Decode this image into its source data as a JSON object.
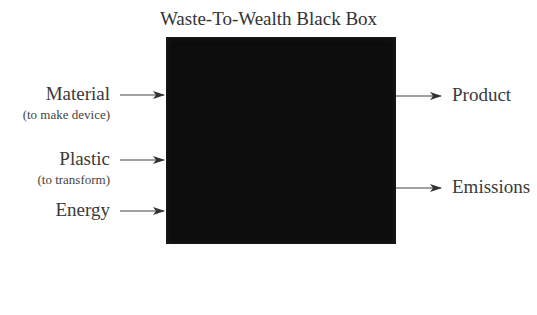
{
  "diagram": {
    "title": "Waste-To-Wealth Black Box",
    "inputs": [
      {
        "label": "Material",
        "sublabel": "(to make device)"
      },
      {
        "label": "Plastic",
        "sublabel": "(to transform)"
      },
      {
        "label": "Energy",
        "sublabel": ""
      }
    ],
    "outputs": [
      {
        "label": "Product"
      },
      {
        "label": "Emissions"
      }
    ],
    "colors": {
      "box": "#0d0d0d",
      "arrow": "#3a3a3a",
      "text": "#3a3a3a"
    }
  }
}
